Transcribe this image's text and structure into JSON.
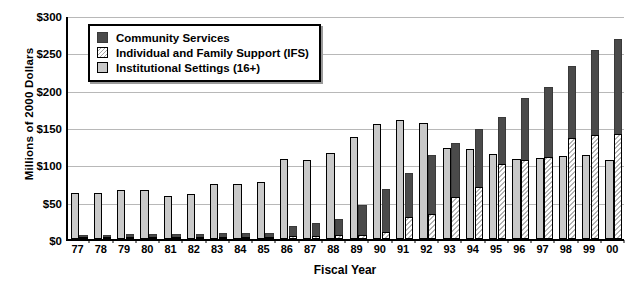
{
  "chart_data": {
    "type": "bar",
    "title": "",
    "xlabel": "Fiscal Year",
    "ylabel": "Millions of 2000 Dollars",
    "ylim": [
      0,
      300
    ],
    "ytick_labels": [
      "$0",
      "$50",
      "$100",
      "$150",
      "$200",
      "$250",
      "$300"
    ],
    "ytick_values": [
      0,
      50,
      100,
      150,
      200,
      250,
      300
    ],
    "grid": true,
    "grid_axis": "y",
    "legend_position": "upper-left-inside",
    "categories": [
      "77",
      "78",
      "79",
      "80",
      "81",
      "82",
      "83",
      "84",
      "85",
      "86",
      "87",
      "88",
      "89",
      "90",
      "91",
      "92",
      "93",
      "94",
      "95",
      "96",
      "97",
      "98",
      "99",
      "00"
    ],
    "series": [
      {
        "name": "Community Services",
        "color": "#4a4a4a",
        "pattern": "solid-dark",
        "values": [
          6,
          6,
          7,
          7,
          7,
          7,
          8,
          8,
          8,
          18,
          21,
          27,
          46,
          67,
          89,
          112,
          129,
          148,
          163,
          189,
          203,
          232,
          253,
          268
        ]
      },
      {
        "name": "Individual and Family Support (IFS)",
        "color": "#b5b5b5",
        "pattern": "diagonal-hatch",
        "values": [
          3,
          3,
          3,
          3,
          3,
          3,
          3,
          3,
          3,
          4,
          4,
          5,
          6,
          9,
          30,
          33,
          56,
          70,
          100,
          106,
          110,
          135,
          139,
          140
        ]
      },
      {
        "name": "Institutional Settings (16+)",
        "color": "#c9c9c9",
        "pattern": "solid-gray",
        "values": [
          62,
          61,
          66,
          65,
          58,
          60,
          74,
          74,
          76,
          107,
          106,
          115,
          136,
          154,
          160,
          156,
          122,
          120,
          114,
          107,
          108,
          111,
          113,
          106
        ]
      }
    ]
  },
  "legend": {
    "items": [
      {
        "label": "Community Services",
        "key": "cs"
      },
      {
        "label": "Individual and Family Support (IFS)",
        "key": "ifs"
      },
      {
        "label": "Institutional Settings (16+)",
        "key": "inst"
      }
    ]
  }
}
